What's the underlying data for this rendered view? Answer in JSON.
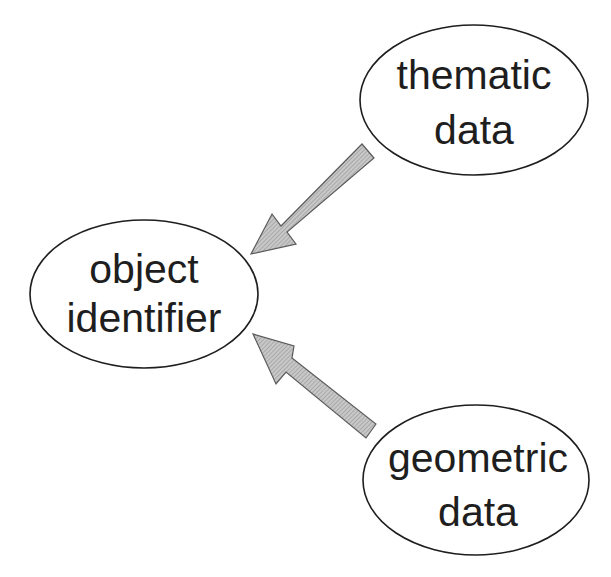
{
  "diagram": {
    "nodes": [
      {
        "id": "object_identifier",
        "lines": [
          "object",
          "identifier"
        ],
        "cx": 144,
        "cy": 294,
        "rx": 114,
        "ry": 74
      },
      {
        "id": "thematic_data",
        "lines": [
          "thematic",
          "data"
        ],
        "cx": 474,
        "cy": 100,
        "rx": 114,
        "ry": 75
      },
      {
        "id": "geometric_data",
        "lines": [
          "geometric",
          "data"
        ],
        "cx": 476,
        "cy": 480,
        "rx": 113,
        "ry": 75
      }
    ],
    "edges": [
      {
        "from": "thematic_data",
        "to": "object_identifier"
      },
      {
        "from": "geometric_data",
        "to": "object_identifier"
      }
    ],
    "colors": {
      "stroke": "#1e1e1e",
      "arrow_fill": "#b4b4b4",
      "arrow_stroke": "#5a5a5a"
    }
  }
}
